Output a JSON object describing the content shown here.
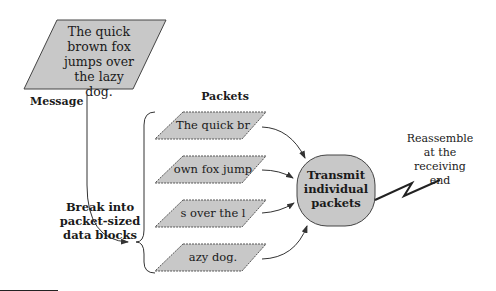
{
  "message": {
    "lines": [
      "The quick",
      "brown fox",
      "jumps over",
      "the lazy dog."
    ],
    "label": "Message"
  },
  "packets": {
    "title": "Packets",
    "items": [
      {
        "text": "The quick br"
      },
      {
        "text": "own fox jump"
      },
      {
        "text": "s over the l"
      },
      {
        "text": "azy dog."
      }
    ]
  },
  "break_step": {
    "lines": [
      "Break into",
      "packet-sized",
      "data blocks"
    ]
  },
  "transmit": {
    "lines": [
      "Transmit",
      "individual",
      "packets"
    ]
  },
  "reassemble": {
    "lines": [
      "Reassemble",
      "at the",
      "receiving",
      "end"
    ]
  },
  "colors": {
    "shape_fill": "#c8c8c8",
    "stroke": "#333333",
    "background": "#ffffff"
  }
}
